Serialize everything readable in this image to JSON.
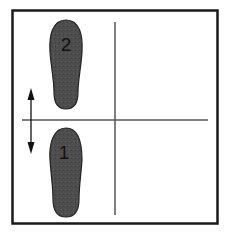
{
  "diagram": {
    "footprints": [
      {
        "id": "footprint-2",
        "label": "2",
        "cx": 66,
        "top": 22,
        "bottom": 108,
        "width": 30
      },
      {
        "id": "footprint-1",
        "label": "1",
        "cx": 66,
        "top": 128,
        "bottom": 218,
        "width": 30
      }
    ],
    "arrow": {
      "type": "double-headed vertical",
      "x": 31,
      "y1": 88,
      "y2": 153
    },
    "colors": {
      "border": "#1a1a1a",
      "line": "#555555",
      "footprint": "#4a4a4a",
      "footprint_stroke": "#222222",
      "arrow": "#111111"
    }
  }
}
